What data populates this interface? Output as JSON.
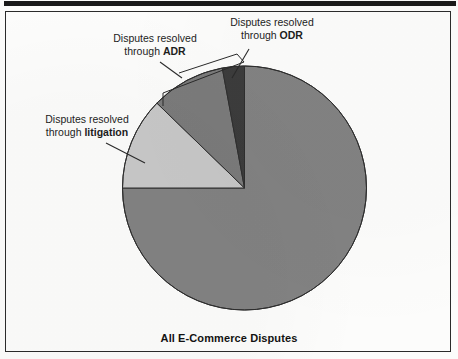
{
  "figure": {
    "caption": "All E-Commerce Disputes",
    "frame_color": "#2b2b2b",
    "background_color": "#fcfcfb"
  },
  "labels": {
    "odr": {
      "line1": "Disputes resolved",
      "line2_prefix": "through ",
      "line2_strong": "ODR"
    },
    "adr": {
      "line1": "Disputes resolved",
      "line2_prefix": "through ",
      "line2_strong": "ADR"
    },
    "litigation": {
      "line1": "Disputes resolved",
      "line2_prefix": "through ",
      "line2_strong": "litigation"
    }
  },
  "chart_data": {
    "type": "pie",
    "title": "All E-Commerce Disputes",
    "xlabel": "",
    "ylabel": "",
    "legend_position": "callout-labels",
    "grid": false,
    "center": {
      "x": 244.5,
      "y": 188
    },
    "radius": 122,
    "start_angle_deg": 0,
    "direction": "counterclockwise",
    "categories": [
      "Disputes resolved through ODR",
      "Disputes resolved through ADR",
      "Disputes resolved through litigation",
      "Unresolved / other e-commerce disputes"
    ],
    "short_labels": [
      "ODR",
      "ADR",
      "litigation",
      "remainder"
    ],
    "values": [
      2.9,
      9.8,
      12.3,
      75.0
    ],
    "units": "percent",
    "angles_deg": [
      10.5,
      35.4,
      44.1,
      270.0
    ],
    "colors": [
      "#3c3c3c",
      "#7b7b7b",
      "#c8c8c8",
      "#828282"
    ],
    "slice_edge_color": "#2e2e2e"
  },
  "colors": {
    "slice_odr": "#3c3c3c",
    "slice_adr": "#7b7b7b",
    "slice_litigation": "#c8c8c8",
    "slice_remainder": "#828282",
    "outline": "#2e2e2e",
    "leader_line": "#2a2a2a",
    "text": "#1d1d1d"
  }
}
